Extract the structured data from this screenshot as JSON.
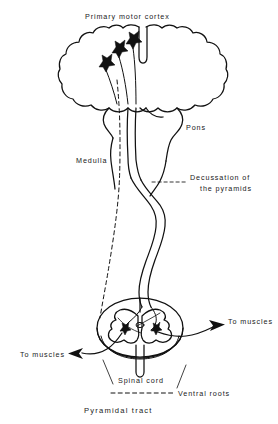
{
  "figure": {
    "title": "Primary motor cortex",
    "caption": "Pyramidal tract",
    "labels": {
      "primary_motor_cortex": "Primary motor cortex",
      "pons": "Pons",
      "medulla": "Medulla",
      "decussation_line1": "Decussation of",
      "decussation_line2": "the pyramids",
      "spinal_cord": "Spinal cord",
      "ventral_roots": "Ventral roots",
      "to_muscles_left": "To muscles",
      "to_muscles_right": "To muscles"
    },
    "colors": {
      "ink": "#111111",
      "background": "#ffffff"
    },
    "structures": [
      "cerebral hemispheres",
      "pons",
      "medulla oblongata",
      "decussation of the pyramids",
      "spinal cord cross-section",
      "ventral roots"
    ],
    "neuron_count_cortex": 3,
    "neuron_count_spinal": 2
  }
}
